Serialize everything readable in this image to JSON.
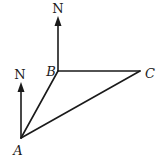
{
  "diagram": {
    "type": "bearing-triangle",
    "points": {
      "A": {
        "label": "A",
        "x": 21,
        "y": 138
      },
      "B": {
        "label": "B",
        "x": 58,
        "y": 71
      },
      "C": {
        "label": "C",
        "x": 140,
        "y": 71
      }
    },
    "segments": [
      {
        "from": "A",
        "to": "B"
      },
      {
        "from": "B",
        "to": "C"
      },
      {
        "from": "A",
        "to": "C"
      }
    ],
    "north_arrows": [
      {
        "at": "A",
        "label": "N"
      },
      {
        "at": "B",
        "label": "N"
      }
    ],
    "colors": {
      "stroke": "#1a1a1a",
      "background": "#ffffff"
    }
  }
}
